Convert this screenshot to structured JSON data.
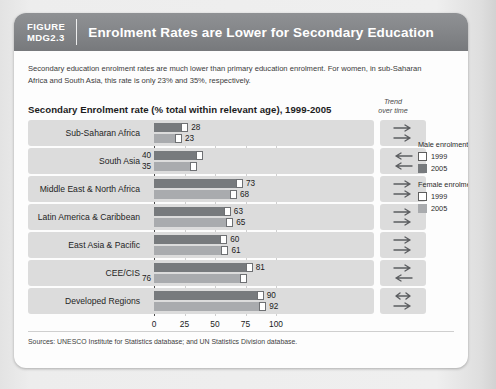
{
  "banner": {
    "figure_label": "FIGURE\nMDG2.3",
    "title": "Enrolment Rates are Lower for Secondary Education"
  },
  "description": "Secondary education enrolment rates are much lower than primary education enrolment. For women, in sub-Saharan Africa and South Asia, this rate is only 23% and 35%, respectively.",
  "chart_title": "Secondary Enrolment rate (% total within relevant age), 1999-2005",
  "trend_header": "Trend\nover time",
  "legend": {
    "male": {
      "header": "Male enrolment:",
      "items": [
        {
          "label": "1999",
          "swatch": "empty"
        },
        {
          "label": "2005",
          "swatch": "male"
        }
      ]
    },
    "female": {
      "header": "Female enrolment:",
      "items": [
        {
          "label": "1999",
          "swatch": "empty"
        },
        {
          "label": "2005",
          "swatch": "female"
        }
      ]
    }
  },
  "sources": "Sources: UNESCO Institute for Statistics database; and UN Statistics Division database.",
  "colors": {
    "banner": "#85878a",
    "male_bar": "#777a7d",
    "female_bar": "#a9abae",
    "row_band": "#dcdcdc",
    "card": "#fdfdfd"
  },
  "chart_data": {
    "type": "bar",
    "orientation": "horizontal",
    "title": "Secondary Enrolment rate (% total within relevant age), 1999-2005",
    "xlabel": "",
    "ylabel": "",
    "xlim": [
      0,
      100
    ],
    "xticks": [
      0,
      25,
      50,
      75,
      100
    ],
    "grid": true,
    "legend_position": "right",
    "categories": [
      "Sub-Saharan Africa",
      "South Asia",
      "Middle East & North Africa",
      "Latin America & Caribbean",
      "East Asia & Pacific",
      "CEE/CIS",
      "Developed Regions"
    ],
    "series": [
      {
        "name": "Male enrolment 2005",
        "values": [
          28,
          40,
          73,
          63,
          60,
          81,
          90
        ]
      },
      {
        "name": "Female enrolment 2005",
        "values": [
          23,
          35,
          68,
          65,
          61,
          76,
          92
        ]
      }
    ],
    "rows": [
      {
        "category": "Sub-Saharan Africa",
        "male": {
          "value": 28,
          "label": "28",
          "marker_1999": true,
          "label_inside": false
        },
        "female": {
          "value": 23,
          "label": "23",
          "marker_1999": true,
          "label_inside": false
        },
        "trend": [
          "right",
          "right"
        ]
      },
      {
        "category": "South Asia",
        "male": {
          "value": 40,
          "label": "40",
          "marker_1999": true,
          "label_inside": true
        },
        "female": {
          "value": 35,
          "label": "35",
          "marker_1999": true,
          "label_inside": true
        },
        "trend": [
          "left",
          "left"
        ]
      },
      {
        "category": "Middle East & North Africa",
        "male": {
          "value": 73,
          "label": "73",
          "marker_1999": true,
          "label_inside": false
        },
        "female": {
          "value": 68,
          "label": "68",
          "marker_1999": true,
          "label_inside": false
        },
        "trend": [
          "right",
          "right"
        ]
      },
      {
        "category": "Latin America & Caribbean",
        "male": {
          "value": 63,
          "label": "63",
          "marker_1999": true,
          "label_inside": false
        },
        "female": {
          "value": 65,
          "label": "65",
          "marker_1999": true,
          "label_inside": false
        },
        "trend": [
          "right",
          "right"
        ]
      },
      {
        "category": "East Asia & Pacific",
        "male": {
          "value": 60,
          "label": "60",
          "marker_1999": true,
          "label_inside": false
        },
        "female": {
          "value": 61,
          "label": "61",
          "marker_1999": true,
          "label_inside": false
        },
        "trend": [
          "right",
          "right"
        ]
      },
      {
        "category": "CEE/CIS",
        "male": {
          "value": 81,
          "label": "81",
          "marker_1999": true,
          "label_inside": false
        },
        "female": {
          "value": 76,
          "label": "76",
          "marker_1999": true,
          "label_inside": true
        },
        "trend": [
          "right",
          "left"
        ]
      },
      {
        "category": "Developed Regions",
        "male": {
          "value": 90,
          "label": "90",
          "marker_1999": true,
          "label_inside": false
        },
        "female": {
          "value": 92,
          "label": "92",
          "marker_1999": true,
          "label_inside": false
        },
        "trend": [
          "both",
          "right"
        ]
      }
    ]
  }
}
